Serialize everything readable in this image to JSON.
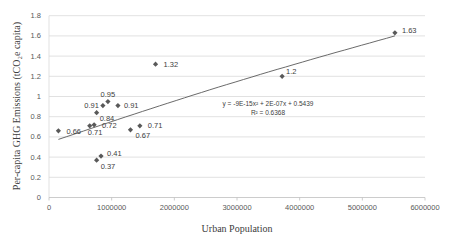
{
  "chart_data": {
    "type": "scatter",
    "title": "",
    "xlabel": "Urban Population",
    "ylabel": "Per-capita GHG Emissions (tCO₂e capita)",
    "xlim": [
      0,
      6000000
    ],
    "ylim": [
      0,
      1.8
    ],
    "x_ticks": [
      "0",
      "1000000",
      "2000000",
      "3000000",
      "4000000",
      "5000000",
      "6000000"
    ],
    "y_ticks": [
      "0",
      "0.2",
      "0.4",
      "0.6",
      "0.8",
      "1",
      "1.2",
      "1.4",
      "1.6",
      "1.8"
    ],
    "grid": "horizontal",
    "legend": "none",
    "marker": "diamond",
    "marker_color": "#595959",
    "series": [
      {
        "name": "Cities",
        "points": [
          {
            "x": 150000,
            "y": 0.66,
            "label": "0.66"
          },
          {
            "x": 650000,
            "y": 0.71,
            "label": "0.71"
          },
          {
            "x": 720000,
            "y": 0.72,
            "label": "0.72"
          },
          {
            "x": 760000,
            "y": 0.84,
            "label": "0.84"
          },
          {
            "x": 860000,
            "y": 0.91,
            "label": "0.91"
          },
          {
            "x": 940000,
            "y": 0.95,
            "label": "0.95"
          },
          {
            "x": 1100000,
            "y": 0.91,
            "label": "0.91"
          },
          {
            "x": 760000,
            "y": 0.37,
            "label": "0.37"
          },
          {
            "x": 830000,
            "y": 0.41,
            "label": "0.41"
          },
          {
            "x": 1300000,
            "y": 0.67,
            "label": "0.67"
          },
          {
            "x": 1450000,
            "y": 0.71,
            "label": "0.71"
          },
          {
            "x": 1700000,
            "y": 1.32,
            "label": "1.32"
          },
          {
            "x": 3720000,
            "y": 1.2,
            "label": "1.2"
          },
          {
            "x": 5520000,
            "y": 1.63,
            "label": "1.63"
          }
        ]
      }
    ],
    "trendline": {
      "type": "polynomial",
      "order": 2,
      "equation": "y = -9E-15x² + 2E-07x + 0.5439",
      "r_squared": "R² = 0.6368",
      "coefficients": {
        "a": -9e-15,
        "b": 2e-07,
        "c": 0.5439
      },
      "x_range": [
        150000,
        5520000
      ]
    }
  }
}
